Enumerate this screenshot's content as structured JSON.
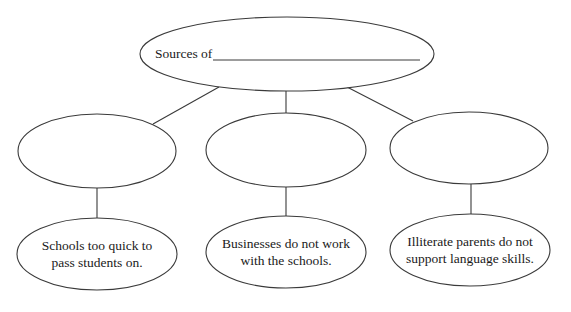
{
  "diagram": {
    "type": "concept-web",
    "root": {
      "label_prefix": "Sources of",
      "blank": ""
    },
    "middle_nodes": [
      {
        "label": ""
      },
      {
        "label": ""
      },
      {
        "label": ""
      }
    ],
    "leaf_nodes": [
      {
        "line1": "Schools too quick to",
        "line2": "pass students on."
      },
      {
        "line1": "Businesses do not work",
        "line2": "with the schools."
      },
      {
        "line1": "Illiterate parents do not",
        "line2": "support language skills."
      }
    ],
    "colors": {
      "stroke": "#3a3a3a",
      "text": "#1a1a1a",
      "background": "#ffffff"
    }
  }
}
